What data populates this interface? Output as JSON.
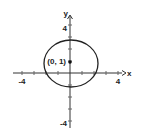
{
  "figure": {
    "axes": {
      "x_label": "x",
      "y_label": "y",
      "x_ticks": {
        "neg": "-4",
        "pos": "4"
      },
      "y_ticks": {
        "neg": "-4",
        "pos": "4"
      },
      "range": [
        -4,
        4
      ]
    },
    "point": {
      "label": "(0, 1)",
      "x": 0,
      "y": 1
    },
    "ellipse": {
      "center": [
        0,
        1
      ],
      "semi_x": 2.25,
      "semi_y": 2
    },
    "colors": {
      "stroke": "#222222",
      "background": "#ffffff"
    }
  }
}
